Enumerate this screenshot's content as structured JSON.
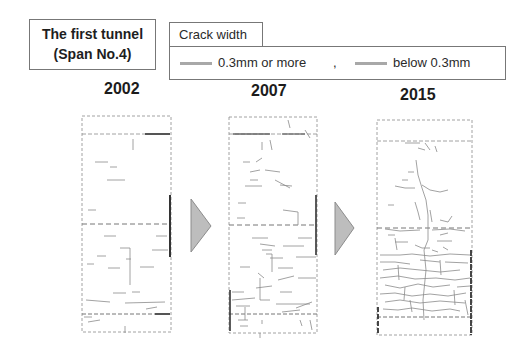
{
  "header": {
    "title_line1": "The first tunnel",
    "title_line2": "(Span No.4)"
  },
  "legend": {
    "title": "Crack width",
    "items": [
      {
        "label": "0.3mm or more",
        "color": "#a8a8a8"
      },
      {
        "label": "below 0.3mm",
        "color": "#a8a8a8"
      }
    ],
    "separator": ","
  },
  "panels": [
    {
      "year": "2002"
    },
    {
      "year": "2007"
    },
    {
      "year": "2015"
    }
  ],
  "arrows": [
    {
      "icon": "triangle-right-arrow",
      "color": "#bdbdbd"
    },
    {
      "icon": "triangle-right-arrow",
      "color": "#bdbdbd"
    }
  ]
}
